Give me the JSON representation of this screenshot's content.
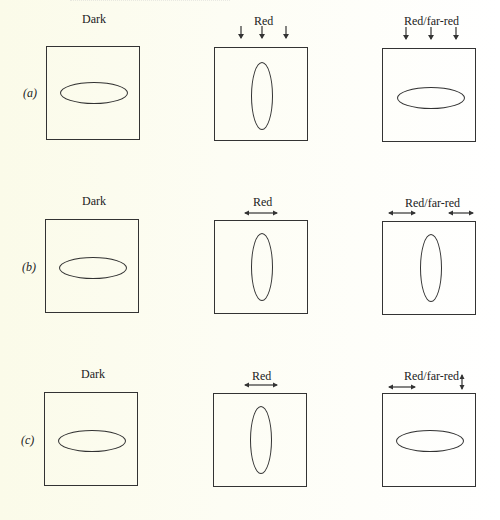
{
  "figure": {
    "columns": [
      "Dark",
      "Red",
      "Red/far-red"
    ],
    "rows": [
      {
        "label": "(a)",
        "panels": [
          {
            "title": "Dark",
            "ellipse": "horizontal",
            "arrows": []
          },
          {
            "title": "Red",
            "ellipse": "vertical",
            "arrows": [
              "down",
              "down",
              "down"
            ]
          },
          {
            "title": "Red/far-red",
            "ellipse": "horizontal",
            "arrows": [
              "down",
              "down",
              "down"
            ]
          }
        ]
      },
      {
        "label": "(b)",
        "panels": [
          {
            "title": "Dark",
            "ellipse": "horizontal",
            "arrows": []
          },
          {
            "title": "Red",
            "ellipse": "vertical",
            "arrows": [
              "horizontal-double"
            ]
          },
          {
            "title": "Red/far-red",
            "ellipse": "vertical",
            "arrows": [
              "horizontal-double",
              "horizontal-double"
            ]
          }
        ]
      },
      {
        "label": "(c)",
        "panels": [
          {
            "title": "Dark",
            "ellipse": "horizontal",
            "arrows": []
          },
          {
            "title": "Red",
            "ellipse": "vertical",
            "arrows": [
              "horizontal-double"
            ]
          },
          {
            "title": "Red/far-red",
            "ellipse": "horizontal",
            "arrows": [
              "horizontal-double",
              "vertical-double"
            ]
          }
        ]
      }
    ],
    "stroke_color": "#333333",
    "background_color": "#fcfcf0"
  }
}
